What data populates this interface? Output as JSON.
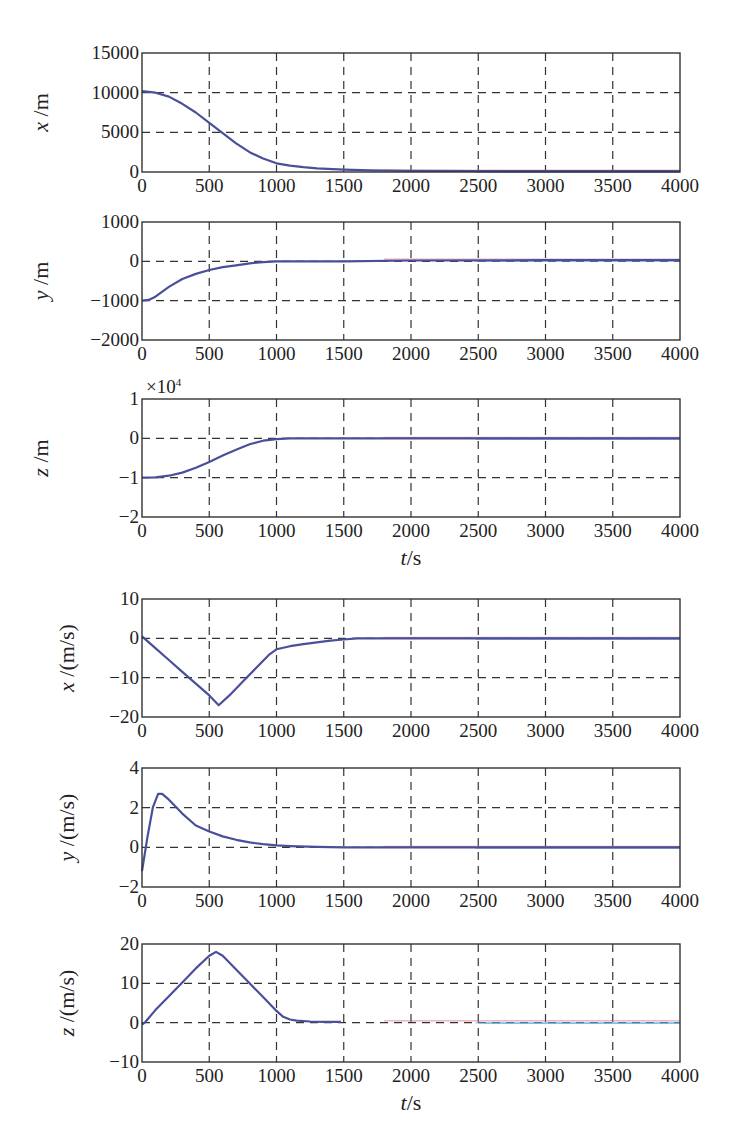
{
  "chart_data": [
    {
      "type": "line",
      "panel": "position-x",
      "ylabel": "x /m",
      "xlabel": "",
      "xlim": [
        0,
        4000
      ],
      "ylim": [
        0,
        15000
      ],
      "xticks": [
        0,
        500,
        1000,
        1500,
        2000,
        2500,
        3000,
        3500,
        4000
      ],
      "yticks": [
        0,
        5000,
        10000,
        15000
      ],
      "ytick_labels": [
        "0",
        "5000",
        "10000",
        "15000"
      ],
      "grid": true,
      "series": [
        {
          "name": "x",
          "color": "#4a4f9a",
          "x": [
            0,
            100,
            200,
            300,
            400,
            500,
            600,
            700,
            800,
            900,
            1000,
            1100,
            1200,
            1300,
            1500,
            1700,
            2000,
            2500,
            3000,
            3500,
            4000
          ],
          "values": [
            10200,
            10000,
            9500,
            8600,
            7500,
            6200,
            4900,
            3600,
            2500,
            1700,
            1100,
            800,
            600,
            450,
            300,
            200,
            150,
            120,
            100,
            100,
            100
          ]
        }
      ]
    },
    {
      "type": "line",
      "panel": "position-y",
      "ylabel": "y /m",
      "xlabel": "",
      "xlim": [
        0,
        4000
      ],
      "ylim": [
        -2000,
        1000
      ],
      "xticks": [
        0,
        500,
        1000,
        1500,
        2000,
        2500,
        3000,
        3500,
        4000
      ],
      "yticks": [
        -2000,
        -1000,
        0,
        1000
      ],
      "ytick_labels": [
        "−2000",
        "−1000",
        "0",
        "1000"
      ],
      "grid": true,
      "series": [
        {
          "name": "y",
          "color": "#4a4f9a",
          "x": [
            0,
            50,
            100,
            200,
            300,
            400,
            500,
            600,
            700,
            800,
            900,
            1000,
            1500,
            2000,
            3000,
            4000
          ],
          "values": [
            -1000,
            -980,
            -900,
            -650,
            -450,
            -320,
            -220,
            -150,
            -100,
            -50,
            -20,
            0,
            0,
            20,
            30,
            30
          ]
        }
      ]
    },
    {
      "type": "line",
      "panel": "position-z",
      "ylabel": "z /m",
      "xlabel": "t/s",
      "xlim": [
        0,
        4000
      ],
      "ylim": [
        -2,
        1
      ],
      "y_multiplier": "×10^4",
      "xticks": [
        0,
        500,
        1000,
        1500,
        2000,
        2500,
        3000,
        3500,
        4000
      ],
      "yticks": [
        -2,
        -1,
        0,
        1
      ],
      "ytick_labels": [
        "−2",
        "−1",
        "0",
        "1"
      ],
      "grid": true,
      "series": [
        {
          "name": "z",
          "color": "#4a4f9a",
          "x": [
            0,
            100,
            200,
            300,
            400,
            500,
            600,
            700,
            800,
            900,
            1000,
            1100,
            1500,
            2000,
            3000,
            4000
          ],
          "values": [
            -1.0,
            -0.99,
            -0.95,
            -0.87,
            -0.75,
            -0.6,
            -0.44,
            -0.29,
            -0.15,
            -0.06,
            -0.02,
            0,
            0,
            0,
            0,
            0
          ]
        }
      ]
    },
    {
      "type": "line",
      "panel": "velocity-x",
      "ylabel": "x /(m/s)",
      "xlabel": "",
      "xlim": [
        0,
        4000
      ],
      "ylim": [
        -20,
        10
      ],
      "xticks": [
        0,
        500,
        1000,
        1500,
        2000,
        2500,
        3000,
        3500,
        4000
      ],
      "yticks": [
        -20,
        -10,
        0,
        10
      ],
      "ytick_labels": [
        "−20",
        "−10",
        "0",
        "10"
      ],
      "grid": true,
      "series": [
        {
          "name": "vx",
          "color": "#4a4f9a",
          "x": [
            0,
            100,
            200,
            300,
            400,
            500,
            570,
            650,
            750,
            850,
            950,
            1000,
            1100,
            1200,
            1300,
            1400,
            1500,
            1600,
            2000,
            3000,
            4000
          ],
          "values": [
            0.5,
            -2.5,
            -5.5,
            -8.5,
            -11.5,
            -14.5,
            -17,
            -14.5,
            -11,
            -7.5,
            -4,
            -2.8,
            -2,
            -1.5,
            -1,
            -0.6,
            -0.3,
            0,
            0,
            0,
            0
          ]
        }
      ]
    },
    {
      "type": "line",
      "panel": "velocity-y",
      "ylabel": "y /(m/s)",
      "xlabel": "",
      "xlim": [
        0,
        4000
      ],
      "ylim": [
        -2,
        4
      ],
      "xticks": [
        0,
        500,
        1000,
        1500,
        2000,
        2500,
        3000,
        3500,
        4000
      ],
      "yticks": [
        -2,
        0,
        2,
        4
      ],
      "ytick_labels": [
        "−2",
        "0",
        "2",
        "4"
      ],
      "grid": true,
      "series": [
        {
          "name": "vy",
          "color": "#4a4f9a",
          "x": [
            0,
            40,
            80,
            120,
            150,
            200,
            300,
            400,
            500,
            600,
            700,
            800,
            900,
            1000,
            1100,
            1300,
            1500,
            2000,
            3000,
            4000
          ],
          "values": [
            -1.2,
            0.5,
            2.0,
            2.7,
            2.7,
            2.4,
            1.7,
            1.1,
            0.8,
            0.55,
            0.38,
            0.25,
            0.16,
            0.1,
            0.06,
            0.02,
            0,
            0,
            0,
            0
          ]
        }
      ]
    },
    {
      "type": "line",
      "panel": "velocity-z",
      "ylabel": "z /(m/s)",
      "xlabel": "t/s",
      "xlim": [
        0,
        4000
      ],
      "ylim": [
        -10,
        20
      ],
      "xticks": [
        0,
        500,
        1000,
        1500,
        2000,
        2500,
        3000,
        3500,
        4000
      ],
      "yticks": [
        -10,
        0,
        10,
        20
      ],
      "ytick_labels": [
        "−10",
        "0",
        "10",
        "20"
      ],
      "grid": true,
      "series": [
        {
          "name": "vz",
          "color": "#4a4f9a",
          "x": [
            0,
            20,
            100,
            200,
            300,
            400,
            500,
            550,
            600,
            700,
            800,
            900,
            1000,
            1050,
            1100,
            1150,
            1250,
            1350,
            1480
          ],
          "values": [
            -0.5,
            0,
            3.2,
            6.7,
            10.2,
            13.8,
            17,
            18,
            17,
            13.5,
            10,
            6.5,
            3,
            1.5,
            0.8,
            0.5,
            0.3,
            0.2,
            0.2
          ]
        }
      ]
    }
  ],
  "figure": {
    "panels": [
      {
        "ylabel_italic": "x",
        "ylabel_unit": " /m",
        "xlabel": ""
      },
      {
        "ylabel_italic": "y",
        "ylabel_unit": " /m",
        "xlabel": ""
      },
      {
        "ylabel_italic": "z",
        "ylabel_unit": " /m",
        "xlabel": "t/s",
        "multiplier": "×10",
        "multiplier_exp": "4"
      },
      {
        "ylabel_italic": "x",
        "ylabel_unit": " /(m/s)",
        "xlabel": ""
      },
      {
        "ylabel_italic": "y",
        "ylabel_unit": " /(m/s)",
        "xlabel": ""
      },
      {
        "ylabel_italic": "z",
        "ylabel_unit": " /(m/s)",
        "xlabel": "t/s"
      }
    ],
    "colors": {
      "primary_curve": "#4a4f9a",
      "secondary_curve": "#d9607a",
      "tertiary_curve": "#5fb4e6",
      "axes": "#333333"
    }
  }
}
